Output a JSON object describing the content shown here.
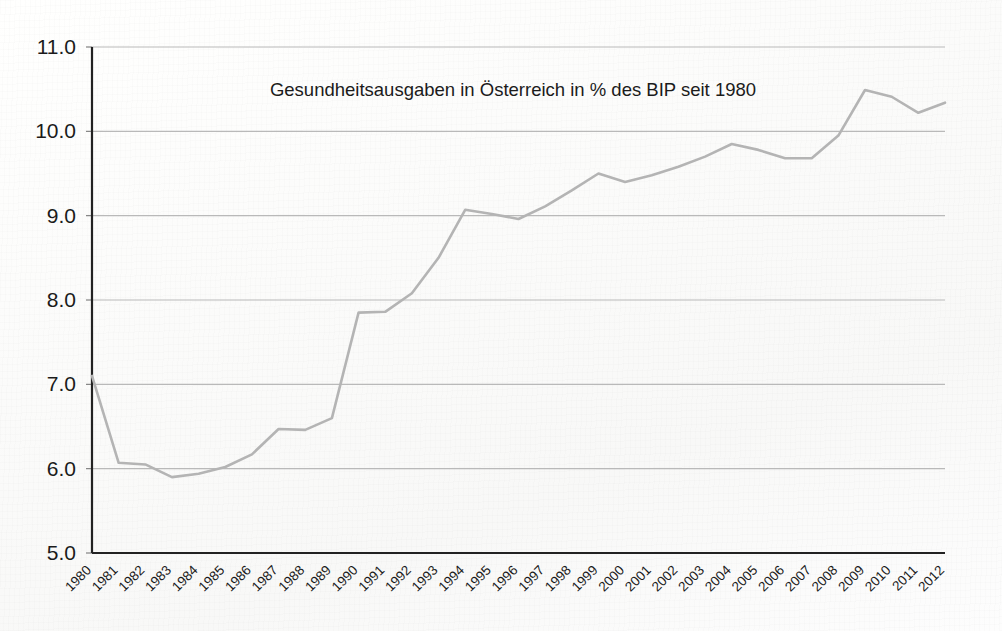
{
  "chart_data": {
    "type": "line",
    "title": "Gesundheitsausgaben in Österreich in % des BIP seit 1980",
    "xlabel": "",
    "ylabel": "",
    "ylim": [
      5.0,
      11.0
    ],
    "ytick_step": 1.0,
    "grid": true,
    "legend": "none",
    "line_color": "#b4b4b4",
    "background_color": "#fdfdfc",
    "axis_color": "#222222",
    "gridline_color": "#b9b9b9",
    "xtick_rotation": -45,
    "ytick_labels": [
      "11.0",
      "10.0",
      "9.0",
      "8.0",
      "7.0",
      "6.0",
      "5.0"
    ],
    "ytick_values": [
      11.0,
      10.0,
      9.0,
      8.0,
      7.0,
      6.0,
      5.0
    ],
    "categories": [
      "1980",
      "1981",
      "1982",
      "1983",
      "1984",
      "1985",
      "1986",
      "1987",
      "1988",
      "1989",
      "1990",
      "1991",
      "1992",
      "1993",
      "1994",
      "1995",
      "1996",
      "1997",
      "1998",
      "1999",
      "2000",
      "2001",
      "2002",
      "2003",
      "2004",
      "2005",
      "2006",
      "2007",
      "2008",
      "2009",
      "2010",
      "2011",
      "2012"
    ],
    "values": [
      7.1,
      6.07,
      6.05,
      5.9,
      5.94,
      6.02,
      6.17,
      6.47,
      6.46,
      6.6,
      7.85,
      7.86,
      8.08,
      8.5,
      9.07,
      9.02,
      8.96,
      9.11,
      9.3,
      9.5,
      9.4,
      9.48,
      9.58,
      9.7,
      9.85,
      9.78,
      9.68,
      9.68,
      9.95,
      10.49,
      10.41,
      10.22,
      10.34
    ],
    "series": [
      {
        "name": "Gesundheitsausgaben in % des BIP",
        "values": [
          7.1,
          6.07,
          6.05,
          5.9,
          5.94,
          6.02,
          6.17,
          6.47,
          6.46,
          6.6,
          7.85,
          7.86,
          8.08,
          8.5,
          9.07,
          9.02,
          8.96,
          9.11,
          9.3,
          9.5,
          9.4,
          9.48,
          9.58,
          9.7,
          9.85,
          9.78,
          9.68,
          9.68,
          9.95,
          10.49,
          10.41,
          10.22,
          10.34
        ]
      }
    ]
  }
}
